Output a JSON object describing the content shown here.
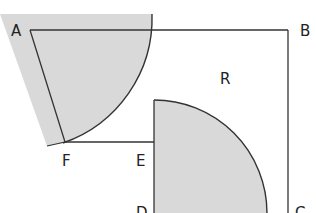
{
  "diagram": {
    "type": "geometry-figure",
    "colors": {
      "shade": "#d9d9d9",
      "line": "#333333",
      "background": "#ffffff"
    },
    "points": {
      "A": "A",
      "B": "B",
      "C": "C",
      "D": "D",
      "E": "E",
      "F": "F"
    },
    "region_label": "R"
  }
}
